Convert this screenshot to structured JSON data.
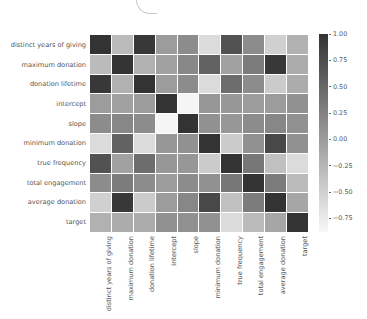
{
  "chart_data": {
    "type": "heatmap",
    "title": "",
    "xlabel": "",
    "ylabel": "",
    "labels": [
      "distinct years of giving",
      "maximum donation",
      "donation lifetime",
      "intercept",
      "slope",
      "minimum donation",
      "true frequency",
      "total engagement",
      "average donation",
      "target"
    ],
    "matrix": [
      [
        1.0,
        -0.3,
        0.95,
        0.0,
        0.15,
        -0.6,
        0.7,
        0.15,
        -0.5,
        -0.2
      ],
      [
        -0.3,
        1.0,
        -0.2,
        -0.05,
        0.2,
        0.55,
        -0.05,
        0.3,
        0.95,
        -0.15
      ],
      [
        0.95,
        -0.2,
        1.0,
        0.0,
        0.15,
        -0.6,
        0.45,
        0.15,
        -0.45,
        -0.15
      ],
      [
        0.0,
        -0.05,
        0.0,
        1.0,
        -0.85,
        0.05,
        0.05,
        0.0,
        0.0,
        0.1
      ],
      [
        0.15,
        0.2,
        0.15,
        -0.85,
        1.0,
        0.1,
        0.05,
        0.15,
        0.2,
        0.1
      ],
      [
        -0.6,
        0.55,
        -0.6,
        0.05,
        0.1,
        1.0,
        -0.45,
        0.1,
        0.8,
        0.1
      ],
      [
        0.7,
        -0.05,
        0.45,
        0.05,
        0.05,
        -0.45,
        1.0,
        0.35,
        -0.35,
        -0.6
      ],
      [
        0.15,
        0.3,
        0.15,
        0.0,
        0.15,
        0.1,
        0.35,
        1.0,
        0.3,
        -0.3
      ],
      [
        -0.5,
        0.95,
        -0.45,
        0.0,
        0.2,
        0.8,
        -0.35,
        0.3,
        1.0,
        -0.1
      ],
      [
        -0.2,
        -0.15,
        -0.15,
        0.1,
        0.1,
        0.1,
        -0.6,
        -0.3,
        -0.1,
        1.0
      ]
    ],
    "colorbar": {
      "ticks": [
        "1.00",
        "0.75",
        "0.50",
        "0.25",
        "0.00",
        "−0.25",
        "−0.50",
        "−0.75"
      ],
      "tick_values": [
        1.0,
        0.75,
        0.5,
        0.25,
        0.0,
        -0.25,
        -0.5,
        -0.75
      ],
      "vmin": -0.88,
      "vmax": 1.0,
      "colormap": "greys (light = low, dark = high)"
    },
    "colors": {
      "high": "#333333",
      "low": "#f8f8f8"
    },
    "grid": false,
    "legend_position": "right (colorbar)"
  }
}
